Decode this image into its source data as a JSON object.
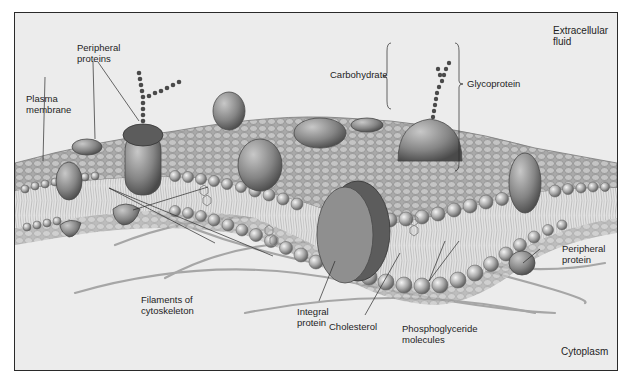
{
  "figure": {
    "colors": {
      "background": "#ececec",
      "frame": "#2a2a2a",
      "protein": "#8c8c8c",
      "protein_dark": "#5c5c5c",
      "head": "#b4b4b4",
      "tail": "#d6d6d6",
      "filament": "#a8a8a8",
      "carbohydrate": "#4a4a4a"
    }
  },
  "labels": {
    "extracellular_fluid": "Extracellular\nfluid",
    "peripheral_proteins": "Peripheral\nproteins",
    "plasma_membrane": "Plasma\nmembrane",
    "carbohydrate": "Carbohydrate",
    "glycoprotein": "Glycoprotein",
    "peripheral_protein": "Peripheral\nprotein",
    "filaments_of_cytoskeleton": "Filaments of\ncytoskeleton",
    "integral_protein": "Integral\nprotein",
    "cholesterol": "Cholesterol",
    "phosphoglyceride_molecules": "Phosphoglyceride\nmolecules",
    "cytoplasm": "Cytoplasm"
  }
}
